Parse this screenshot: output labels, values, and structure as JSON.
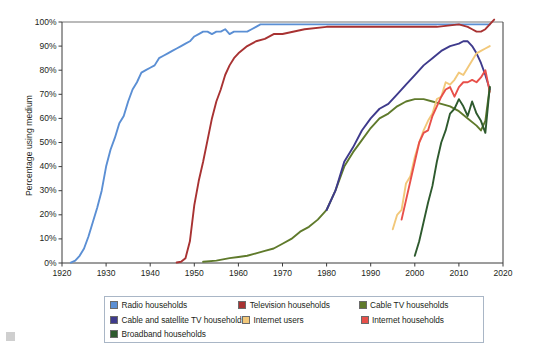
{
  "chart_data": {
    "type": "line",
    "title": "",
    "xlabel": "",
    "ylabel": "Percentage using medium",
    "xlim": [
      1920,
      2020
    ],
    "ylim": [
      0,
      100
    ],
    "grid": false,
    "legend_position": "bottom",
    "x_ticks": [
      "1920",
      "1930",
      "1940",
      "1950",
      "1960",
      "1970",
      "1980",
      "1990",
      "2000",
      "2010",
      "2020"
    ],
    "y_ticks": [
      "0%",
      "10%",
      "20%",
      "30%",
      "40%",
      "50%",
      "60%",
      "70%",
      "80%",
      "90%",
      "100%"
    ],
    "series": [
      {
        "name": "Radio households",
        "color": "#5b8fd4",
        "x": [
          1922,
          1923,
          1924,
          1925,
          1926,
          1927,
          1928,
          1929,
          1930,
          1931,
          1932,
          1933,
          1934,
          1935,
          1936,
          1937,
          1938,
          1939,
          1940,
          1941,
          1942,
          1943,
          1944,
          1945,
          1946,
          1947,
          1948,
          1949,
          1950,
          1951,
          1952,
          1953,
          1954,
          1955,
          1956,
          1957,
          1958,
          1959,
          1960,
          1961,
          1962,
          1963,
          1964,
          1965,
          1970,
          1975,
          1980,
          1985,
          1990,
          1995,
          2000,
          2005,
          2010,
          2015,
          2017
        ],
        "values": [
          0.2,
          1,
          3,
          6,
          11,
          17,
          23,
          30,
          40,
          47,
          52,
          58,
          61,
          67,
          72,
          75,
          79,
          80,
          81,
          82,
          85,
          86,
          87,
          88,
          89,
          90,
          91,
          92,
          94,
          95,
          96,
          96,
          95,
          96,
          96,
          97,
          95,
          96,
          96,
          96,
          96,
          97,
          98,
          99,
          99,
          99,
          99,
          99,
          99,
          99,
          99,
          99,
          99,
          99,
          99
        ]
      },
      {
        "name": "Television households",
        "color": "#a83232",
        "x": [
          1946,
          1947,
          1948,
          1949,
          1950,
          1951,
          1952,
          1953,
          1954,
          1955,
          1956,
          1957,
          1958,
          1959,
          1960,
          1962,
          1964,
          1966,
          1968,
          1970,
          1975,
          1980,
          1985,
          1990,
          1995,
          2000,
          2005,
          2010,
          2012,
          2013,
          2014,
          2015,
          2016,
          2017,
          2018
        ],
        "values": [
          0.2,
          0.5,
          2,
          9,
          24,
          34,
          42,
          51,
          60,
          67,
          72,
          78,
          82,
          85,
          87,
          90,
          92,
          93,
          95,
          95,
          97,
          98,
          98,
          98,
          98,
          98,
          98,
          99,
          98,
          97,
          96,
          96,
          97,
          99,
          101
        ]
      },
      {
        "name": "Cable TV households",
        "color": "#5f7a2b",
        "x": [
          1952,
          1955,
          1958,
          1960,
          1962,
          1964,
          1966,
          1968,
          1970,
          1972,
          1974,
          1976,
          1978,
          1980,
          1982,
          1984,
          1986,
          1988,
          1990,
          1992,
          1994,
          1996,
          1998,
          2000,
          2002,
          2004,
          2006,
          2008,
          2010,
          2012,
          2014,
          2015,
          2016,
          2017
        ],
        "values": [
          0.5,
          1,
          2,
          2.5,
          3,
          4,
          5,
          6,
          8,
          10,
          13,
          15,
          18,
          22,
          30,
          40,
          46,
          51,
          56,
          60,
          62,
          65,
          67,
          68,
          68,
          67,
          66,
          65,
          63,
          60,
          57,
          55,
          59,
          73
        ]
      },
      {
        "name": "Cable and satellite TV households",
        "color": "#3e3a8c",
        "x": [
          1980,
          1982,
          1984,
          1986,
          1988,
          1990,
          1992,
          1994,
          1996,
          1998,
          2000,
          2002,
          2004,
          2006,
          2008,
          2010,
          2011,
          2012,
          2013,
          2014,
          2015,
          2016,
          2017
        ],
        "values": [
          22,
          30,
          42,
          48,
          55,
          60,
          64,
          66,
          70,
          74,
          78,
          82,
          85,
          88,
          90,
          91,
          92,
          92,
          90,
          87,
          83,
          78,
          72
        ]
      },
      {
        "name": "Internet users",
        "color": "#f2c87a",
        "x": [
          1995,
          1996,
          1997,
          1998,
          1999,
          2000,
          2001,
          2002,
          2003,
          2004,
          2005,
          2006,
          2007,
          2008,
          2009,
          2010,
          2011,
          2012,
          2013,
          2014,
          2015,
          2016,
          2017
        ],
        "values": [
          14,
          20,
          22,
          33,
          36,
          44,
          50,
          55,
          59,
          62,
          68,
          69,
          75,
          74,
          76,
          79,
          78,
          81,
          84,
          87,
          88,
          89,
          90
        ]
      },
      {
        "name": "Internet households",
        "color": "#e8504a",
        "x": [
          1997,
          1998,
          1999,
          2000,
          2001,
          2002,
          2003,
          2004,
          2005,
          2006,
          2007,
          2008,
          2009,
          2010,
          2011,
          2012,
          2013,
          2014,
          2015,
          2016,
          2017
        ],
        "values": [
          18,
          26,
          34,
          42,
          50,
          54,
          55,
          61,
          65,
          69,
          72,
          73,
          69,
          73,
          75,
          75,
          76,
          75,
          77,
          80,
          71
        ]
      },
      {
        "name": "Broadband households",
        "color": "#2e5a2e",
        "x": [
          2000,
          2001,
          2002,
          2003,
          2004,
          2005,
          2006,
          2007,
          2008,
          2009,
          2010,
          2011,
          2012,
          2013,
          2014,
          2015,
          2016,
          2017
        ],
        "values": [
          3,
          9,
          17,
          25,
          32,
          42,
          50,
          55,
          62,
          64,
          68,
          65,
          61,
          67,
          62,
          59,
          54,
          73
        ]
      }
    ]
  },
  "legend": {
    "rows": [
      [
        {
          "label": "Radio households",
          "color": "#5b8fd4"
        },
        {
          "label": "Television households",
          "color": "#a83232"
        },
        {
          "label": "Cable TV households",
          "color": "#5f7a2b"
        }
      ],
      [
        {
          "label": "Cable and satellite TV households",
          "color": "#3e3a8c"
        },
        {
          "label": "Internet users",
          "color": "#f2c87a"
        },
        {
          "label": "Internet households",
          "color": "#e8504a"
        }
      ],
      [
        {
          "label": "Broadband households",
          "color": "#2e5a2e"
        }
      ]
    ]
  },
  "axis": {
    "y_title": "Percentage using medium"
  }
}
